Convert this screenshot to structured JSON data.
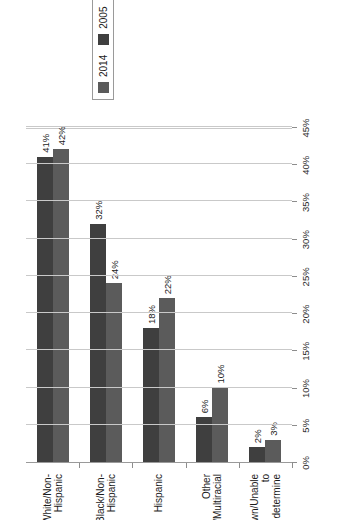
{
  "chart_data": {
    "type": "bar",
    "title": "",
    "xlabel": "",
    "ylabel": "",
    "ylim": [
      0,
      45
    ],
    "grid": true,
    "orientation": "vertical-rotated",
    "legend_position": "right",
    "tick_labels": [
      "0%",
      "5%",
      "10%",
      "15%",
      "20%",
      "25%",
      "30%",
      "35%",
      "40%",
      "45%"
    ],
    "tick_values": [
      0,
      5,
      10,
      15,
      20,
      25,
      30,
      35,
      40,
      45
    ],
    "categories": [
      "White/Non-Hispanic",
      "Black/Non-Hispanic",
      "Hispanic",
      "Other Races/Multiracial",
      "Unknown/Unable to\ndetermine"
    ],
    "series": [
      {
        "name": "2005",
        "color": "#3f3f3f",
        "values": [
          41,
          32,
          18,
          6,
          2
        ],
        "labels": [
          "41%",
          "32%",
          "18%",
          "6%",
          "2%"
        ]
      },
      {
        "name": "2014",
        "color": "#5b5b5b",
        "values": [
          42,
          24,
          22,
          10,
          3
        ],
        "labels": [
          "42%",
          "24%",
          "22%",
          "10%",
          "3%"
        ]
      }
    ]
  },
  "legend": {
    "items": [
      {
        "label": "2005",
        "color": "#3f3f3f"
      },
      {
        "label": "2014",
        "color": "#5b5b5b"
      }
    ]
  }
}
